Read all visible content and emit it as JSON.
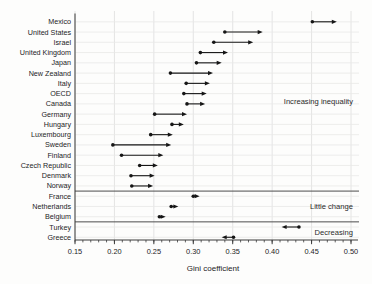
{
  "figure": {
    "background": "#fdfdfc"
  },
  "chart_data": {
    "type": "scatter",
    "variant": "dot-arrow-change",
    "title": "",
    "xlabel": "Gini coefficient",
    "ylabel": "",
    "xlim": [
      0.15,
      0.5
    ],
    "x_major_ticks": [
      0.15,
      0.2,
      0.25,
      0.3,
      0.35,
      0.4,
      0.45,
      0.5
    ],
    "x_tick_labels": [
      "0.15",
      "0.20",
      "0.25",
      "0.30",
      "0.35",
      "0.40",
      "0.45",
      "0.50"
    ],
    "x_minor_step": 0.01,
    "grid": true,
    "legend": "none",
    "marker_meaning": {
      "dot": "earlier value",
      "arrowhead": "later value"
    },
    "rows": [
      {
        "label": "Mexico",
        "start": 0.451,
        "end": 0.482,
        "group": "increasing"
      },
      {
        "label": "United States",
        "start": 0.34,
        "end": 0.388,
        "group": "increasing"
      },
      {
        "label": "Israel",
        "start": 0.326,
        "end": 0.376,
        "group": "increasing"
      },
      {
        "label": "United Kingdom",
        "start": 0.309,
        "end": 0.344,
        "group": "increasing"
      },
      {
        "label": "Japan",
        "start": 0.304,
        "end": 0.336,
        "group": "increasing"
      },
      {
        "label": "New Zealand",
        "start": 0.271,
        "end": 0.325,
        "group": "increasing"
      },
      {
        "label": "Italy",
        "start": 0.291,
        "end": 0.321,
        "group": "increasing"
      },
      {
        "label": "OECD",
        "start": 0.288,
        "end": 0.317,
        "group": "increasing"
      },
      {
        "label": "Canada",
        "start": 0.292,
        "end": 0.315,
        "group": "increasing"
      },
      {
        "label": "Germany",
        "start": 0.251,
        "end": 0.292,
        "group": "increasing"
      },
      {
        "label": "Hungary",
        "start": 0.273,
        "end": 0.288,
        "group": "increasing"
      },
      {
        "label": "Luxembourg",
        "start": 0.246,
        "end": 0.274,
        "group": "increasing"
      },
      {
        "label": "Sweden",
        "start": 0.198,
        "end": 0.272,
        "group": "increasing"
      },
      {
        "label": "Finland",
        "start": 0.209,
        "end": 0.262,
        "group": "increasing"
      },
      {
        "label": "Czech Republic",
        "start": 0.232,
        "end": 0.255,
        "group": "increasing"
      },
      {
        "label": "Denmark",
        "start": 0.221,
        "end": 0.251,
        "group": "increasing"
      },
      {
        "label": "Norway",
        "start": 0.222,
        "end": 0.249,
        "group": "increasing"
      },
      {
        "label": "France",
        "start": 0.3,
        "end": 0.308,
        "group": "little-change"
      },
      {
        "label": "Netherlands",
        "start": 0.272,
        "end": 0.281,
        "group": "little-change"
      },
      {
        "label": "Belgium",
        "start": 0.257,
        "end": 0.265,
        "group": "little-change"
      },
      {
        "label": "Turkey",
        "start": 0.434,
        "end": 0.412,
        "group": "decreasing"
      },
      {
        "label": "Greece",
        "start": 0.351,
        "end": 0.336,
        "group": "decreasing"
      }
    ],
    "annotations": [
      {
        "text": "Increasing inequality",
        "y_row": 7.72
      },
      {
        "text": "Little change",
        "y_row": 18.05
      },
      {
        "text": "Decreasing",
        "y_row": 20.58
      }
    ],
    "colors": {
      "marker": "#161616",
      "grid_vertical": "#dddddd",
      "grid_horizontal": "#e8e8e7",
      "axis": "#3a3a3a",
      "separator": "#4d4d4d",
      "text": "#1c1c1c",
      "annotation_text": "#2a2a2a",
      "background": "#fdfdfc"
    }
  }
}
